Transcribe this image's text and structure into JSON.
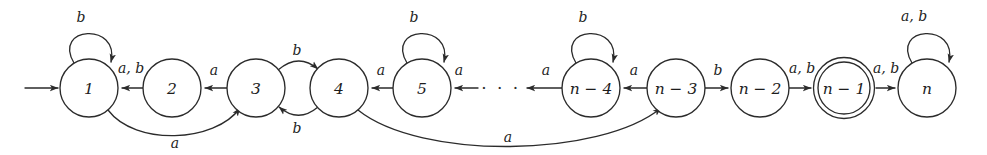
{
  "figure": {
    "name": "finite-automaton-state-diagram",
    "kind": "state-transition-diagram",
    "colors": {
      "stroke": "#2b2b2b",
      "text": "#1d1d1d",
      "background": "#ffffff"
    }
  },
  "states": [
    {
      "id": "s1",
      "label": "1",
      "cx": 89,
      "cy": 88,
      "r": 29,
      "accepting": false,
      "start": true
    },
    {
      "id": "s2",
      "label": "2",
      "cx": 172,
      "cy": 88,
      "r": 29,
      "accepting": false,
      "start": false
    },
    {
      "id": "s3",
      "label": "3",
      "cx": 256,
      "cy": 88,
      "r": 29,
      "accepting": false,
      "start": false
    },
    {
      "id": "s4",
      "label": "4",
      "cx": 339,
      "cy": 88,
      "r": 29,
      "accepting": false,
      "start": false
    },
    {
      "id": "s5",
      "label": "5",
      "cx": 422,
      "cy": 88,
      "r": 29,
      "accepting": false,
      "start": false
    },
    {
      "id": "sn4",
      "label": "n − 4",
      "cx": 591,
      "cy": 88,
      "r": 29,
      "accepting": false,
      "start": false
    },
    {
      "id": "sn3",
      "label": "n − 3",
      "cx": 676,
      "cy": 88,
      "r": 29,
      "accepting": false,
      "start": false
    },
    {
      "id": "sn2",
      "label": "n − 2",
      "cx": 760,
      "cy": 88,
      "r": 29,
      "accepting": false,
      "start": false
    },
    {
      "id": "sn1",
      "label": "n − 1",
      "cx": 844,
      "cy": 88,
      "r": 29,
      "accepting": true,
      "start": false
    },
    {
      "id": "sn",
      "label": "n",
      "cx": 927,
      "cy": 88,
      "r": 29,
      "accepting": false,
      "start": false
    }
  ],
  "ellipsis": {
    "text": "· · ·",
    "x": 501,
    "y": 88
  },
  "start_arrow": {
    "x1": 25,
    "y1": 88,
    "x2": 58,
    "y2": 88
  },
  "edges": [
    {
      "id": "e-self-1",
      "from": "s1",
      "to": "s1",
      "label": "b",
      "label_x": 81,
      "label_y": 17,
      "kind": "self-loop"
    },
    {
      "id": "e-2-1",
      "from": "s2",
      "to": "s1",
      "label": "a, b",
      "label_x": 131,
      "label_y": 68,
      "kind": "straight-left"
    },
    {
      "id": "e-3-2",
      "from": "s3",
      "to": "s2",
      "label": "a",
      "label_x": 214,
      "label_y": 70,
      "kind": "straight-left"
    },
    {
      "id": "e-3-4",
      "from": "s3",
      "to": "s4",
      "label": "b",
      "label_x": 297,
      "label_y": 50,
      "kind": "curve-over"
    },
    {
      "id": "e-4-3",
      "from": "s4",
      "to": "s3",
      "label": "b",
      "label_x": 297,
      "label_y": 128,
      "kind": "curve-under"
    },
    {
      "id": "e-5-4",
      "from": "s5",
      "to": "s4",
      "label": "a",
      "label_x": 381,
      "label_y": 70,
      "kind": "straight-left"
    },
    {
      "id": "e-self-5",
      "from": "s5",
      "to": "s5",
      "label": "b",
      "label_x": 414,
      "label_y": 17,
      "kind": "self-loop"
    },
    {
      "id": "e-dots-5",
      "from": "dots",
      "to": "s5",
      "label": "a",
      "label_x": 459,
      "label_y": 70,
      "kind": "straight-left"
    },
    {
      "id": "e-n4-dots",
      "from": "sn4",
      "to": "dots",
      "label": "a",
      "label_x": 546,
      "label_y": 70,
      "kind": "straight-left"
    },
    {
      "id": "e-self-n4",
      "from": "sn4",
      "to": "sn4",
      "label": "b",
      "label_x": 583,
      "label_y": 17,
      "kind": "self-loop"
    },
    {
      "id": "e-n3-n4",
      "from": "sn3",
      "to": "sn4",
      "label": "a",
      "label_x": 634,
      "label_y": 70,
      "kind": "straight-left"
    },
    {
      "id": "e-n3-n2",
      "from": "sn3",
      "to": "sn2",
      "label": "b",
      "label_x": 718,
      "label_y": 70,
      "kind": "straight-right"
    },
    {
      "id": "e-n2-n1",
      "from": "sn2",
      "to": "sn1",
      "label": "a, b",
      "label_x": 802,
      "label_y": 68,
      "kind": "straight-right"
    },
    {
      "id": "e-n1-n",
      "from": "sn1",
      "to": "sn",
      "label": "a, b",
      "label_x": 886,
      "label_y": 68,
      "kind": "straight-right"
    },
    {
      "id": "e-self-n",
      "from": "sn",
      "to": "sn",
      "label": "a, b",
      "label_x": 914,
      "label_y": 16,
      "kind": "self-loop"
    },
    {
      "id": "e-arc-1-3",
      "from": "s1",
      "to": "s3",
      "label": "a",
      "label_x": 175,
      "label_y": 143,
      "kind": "long-arc"
    },
    {
      "id": "e-arc-4-n3",
      "from": "s4",
      "to": "sn3",
      "label": "a",
      "label_x": 508,
      "label_y": 137,
      "kind": "long-arc"
    }
  ]
}
